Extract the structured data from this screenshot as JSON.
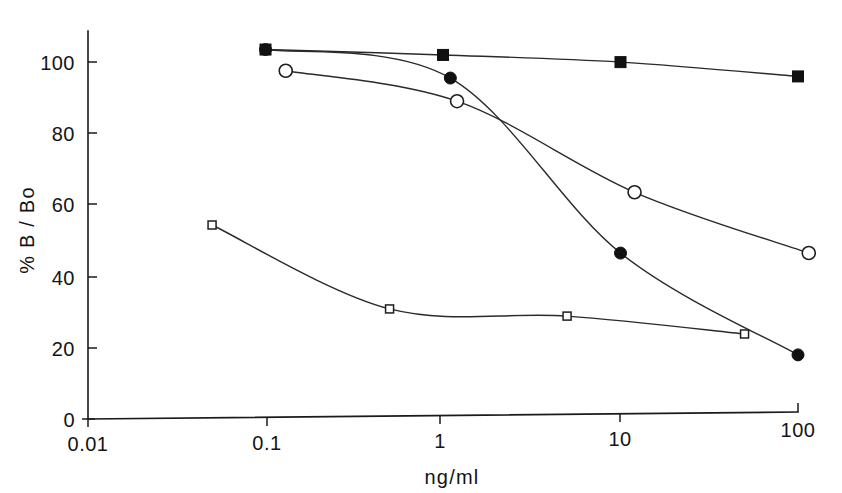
{
  "chart_data": {
    "type": "line",
    "title": "",
    "subtitle": "",
    "xlabel": "ng/ml",
    "ylabel": "% B / Bo",
    "xscale": "log",
    "xlim": [
      0.01,
      100
    ],
    "ylim": [
      0,
      108
    ],
    "grid": false,
    "legend": "none",
    "x_tick_labels": [
      "0.01",
      "0.1",
      "1",
      "10",
      "100"
    ],
    "x_tick_values": [
      0.01,
      0.1,
      1,
      10,
      100
    ],
    "y_tick_labels": [
      "0",
      "20",
      "40",
      "60",
      "80",
      "100"
    ],
    "y_tick_values": [
      0,
      20,
      40,
      60,
      80,
      100
    ],
    "series": [
      {
        "name": "filled-square",
        "marker": "filled square",
        "x": [
          0.1,
          1.0,
          10.0,
          100.0
        ],
        "y": [
          103.0,
          101.0,
          98.5,
          94.0
        ]
      },
      {
        "name": "filled-circle",
        "marker": "filled circle",
        "x": [
          0.1,
          1.1,
          10.0,
          100.0
        ],
        "y": [
          103.0,
          94.5,
          45.0,
          16.0
        ]
      },
      {
        "name": "open-circle",
        "marker": "open circle",
        "x": [
          0.13,
          1.2,
          12.0,
          115.0
        ],
        "y": [
          97.0,
          88.0,
          62.0,
          44.5
        ]
      },
      {
        "name": "open-square",
        "marker": "open square",
        "x": [
          0.05,
          0.5,
          5.0,
          50.0
        ],
        "y": [
          54.0,
          30.0,
          27.5,
          22.0
        ]
      }
    ]
  },
  "axes": {
    "x_axis_name": "x-axis",
    "y_axis_name": "y-axis"
  }
}
